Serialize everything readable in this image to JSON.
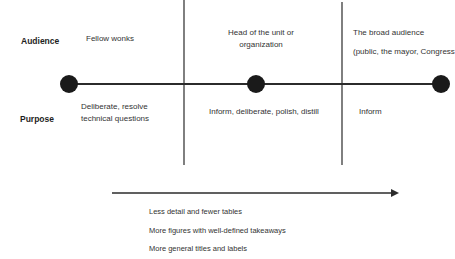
{
  "row_labels": {
    "audience": "Audience",
    "purpose": "Purpose"
  },
  "columns": [
    {
      "audience": [
        "Fellow wonks"
      ],
      "purpose": [
        "Deliberate, resolve",
        "technical questions"
      ]
    },
    {
      "audience": [
        "Head of the unit or",
        "organization"
      ],
      "purpose": [
        "Inform, deliberate, polish, distill"
      ]
    },
    {
      "audience": [
        "The broad audience",
        "(public, the mayor, Congress"
      ],
      "purpose": [
        "Inform"
      ]
    }
  ],
  "trend": {
    "items": [
      "Less detail and fewer tables",
      "More figures with well-defined takeaways",
      "More general titles and labels"
    ]
  },
  "colors": {
    "line": "#2b2b2b",
    "node": "#1a1a1a"
  }
}
